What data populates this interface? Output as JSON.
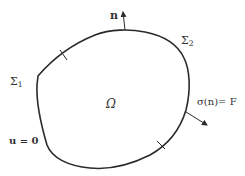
{
  "diagram": {
    "labels": {
      "normal": "n",
      "sigma1": "Σ",
      "sigma1_sub": "1",
      "sigma2": "Σ",
      "sigma2_sub": "2",
      "domain": "Ω",
      "traction": "σ(n)= F",
      "dirichlet": "u = 0"
    },
    "colors": {
      "stroke": "#2a2a2a",
      "text": "#333333",
      "background": "#ffffff"
    }
  }
}
